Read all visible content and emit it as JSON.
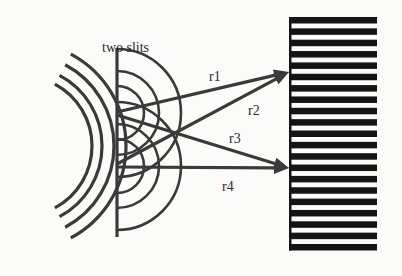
{
  "figure": {
    "title_label": "two slits",
    "ray_labels": [
      "r1",
      "r2",
      "r3",
      "r4"
    ]
  },
  "colors": {
    "background": "#fbfbfa",
    "line": "#3a3a3a",
    "fringe": "#141414",
    "text": "#2a2a2a"
  },
  "geometry": {
    "source_waves": {
      "cx": 22,
      "cy": 146,
      "radii": [
        70,
        80,
        92,
        104
      ],
      "angle_deg": 62
    },
    "barrier": {
      "x": 117,
      "y1": 48,
      "y2": 237
    },
    "slits": [
      {
        "x": 117,
        "y": 113
      },
      {
        "x": 117,
        "y": 166
      }
    ],
    "slit_wave_radii": [
      27,
      42,
      64
    ],
    "rays": [
      {
        "label": "r1",
        "from": [
          117,
          112
        ],
        "to": [
          289,
          72
        ]
      },
      {
        "label": "r2",
        "from": [
          117,
          164
        ],
        "to": [
          289,
          72
        ]
      },
      {
        "label": "r3",
        "from": [
          117,
          115
        ],
        "to": [
          289,
          168
        ]
      },
      {
        "label": "r4",
        "from": [
          117,
          167
        ],
        "to": [
          289,
          168
        ]
      }
    ],
    "screen": {
      "x": 289,
      "width": 88,
      "y_start": 17,
      "count": 21,
      "spacing": 11.35,
      "bar_height": 6.5
    }
  }
}
